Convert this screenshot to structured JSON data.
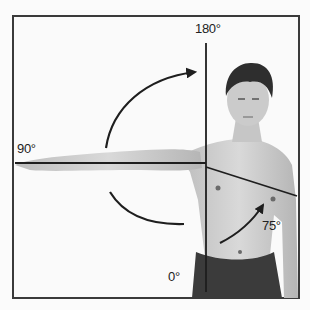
{
  "figure": {
    "labels": {
      "top": "180°",
      "left": "90°",
      "bottom": "0°",
      "adduction": "75°"
    },
    "colors": {
      "line": "#1e1e1e",
      "frame": "#3a3a3a",
      "skin": "#cfcfcf",
      "hair": "#2e2e2e",
      "shorts": "#3b3b3b",
      "background": "#fafafa"
    }
  }
}
